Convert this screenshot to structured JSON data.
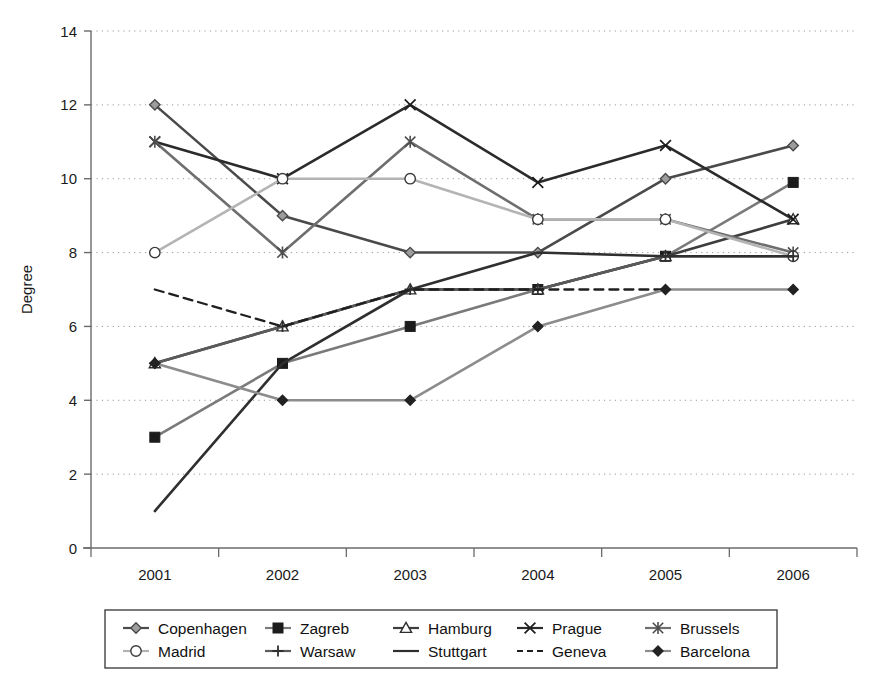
{
  "chart_data": {
    "type": "line",
    "title": "",
    "xlabel": "",
    "ylabel": "Degree",
    "categories": [
      "2001",
      "2002",
      "2003",
      "2004",
      "2005",
      "2006"
    ],
    "x_tick_labels": [
      "2001",
      "2002",
      "2003",
      "2004",
      "2005",
      "2006"
    ],
    "y_tick_labels": [
      "0",
      "2",
      "4",
      "6",
      "8",
      "10",
      "12",
      "14"
    ],
    "y_ticks": [
      0,
      2,
      4,
      6,
      8,
      10,
      12,
      14
    ],
    "ylim": [
      0,
      14
    ],
    "grid": "horizontal-dotted",
    "legend_position": "bottom",
    "legend_columns": 5,
    "legend_rows": 2,
    "series": [
      {
        "name": "Copenhagen",
        "marker": "diamond-open",
        "line": "solid",
        "color": "#4a4a4a",
        "values": [
          12,
          9,
          8,
          8,
          10,
          10.9
        ]
      },
      {
        "name": "Zagreb",
        "marker": "square-filled",
        "line": "solid",
        "color": "#7a7a7a",
        "values": [
          3,
          5,
          6,
          7,
          7.9,
          9.9
        ]
      },
      {
        "name": "Hamburg",
        "marker": "triangle-open",
        "line": "solid",
        "color": "#3d3d3d",
        "values": [
          5,
          6,
          7,
          7,
          7.9,
          8.9
        ]
      },
      {
        "name": "Prague",
        "marker": "x-cross",
        "line": "solid",
        "color": "#2b2b2b",
        "values": [
          11,
          10,
          12,
          9.9,
          10.9,
          8.9
        ]
      },
      {
        "name": "Brussels",
        "marker": "asterisk",
        "line": "solid",
        "color": "#6e6e6e",
        "values": [
          11,
          8,
          11,
          8.9,
          8.9,
          8
        ]
      },
      {
        "name": "Madrid",
        "marker": "circle-open",
        "line": "solid",
        "color": "#b4b4b4",
        "values": [
          8,
          10,
          10,
          8.9,
          8.9,
          7.9
        ]
      },
      {
        "name": "Warsaw",
        "marker": "plus",
        "line": "solid",
        "color": "#5a5a5a",
        "values": [
          5,
          6,
          7,
          7,
          7.9,
          7.9
        ]
      },
      {
        "name": "Stuttgart",
        "marker": "none",
        "line": "solid",
        "color": "#2f2f2f",
        "values": [
          1,
          5,
          7,
          8,
          7.9,
          7.9
        ]
      },
      {
        "name": "Geneva",
        "marker": "none",
        "line": "dashed",
        "color": "#1f1f1f",
        "values": [
          7,
          6,
          7,
          7,
          7,
          null
        ]
      },
      {
        "name": "Barcelona",
        "marker": "diamond-filled",
        "line": "solid",
        "color": "#8c8c8c",
        "values": [
          5,
          4,
          4,
          6,
          7,
          7
        ]
      }
    ]
  },
  "legend": {
    "items": [
      {
        "label": "Copenhagen"
      },
      {
        "label": "Zagreb"
      },
      {
        "label": "Hamburg"
      },
      {
        "label": "Prague"
      },
      {
        "label": "Brussels"
      },
      {
        "label": "Madrid"
      },
      {
        "label": "Warsaw"
      },
      {
        "label": "Stuttgart"
      },
      {
        "label": "Geneva"
      },
      {
        "label": "Barcelona"
      }
    ]
  },
  "colors": {
    "background": "#ffffff",
    "axis": "#6b6b6b",
    "grid": "#9a9a9a",
    "text": "#1a1a1a"
  }
}
